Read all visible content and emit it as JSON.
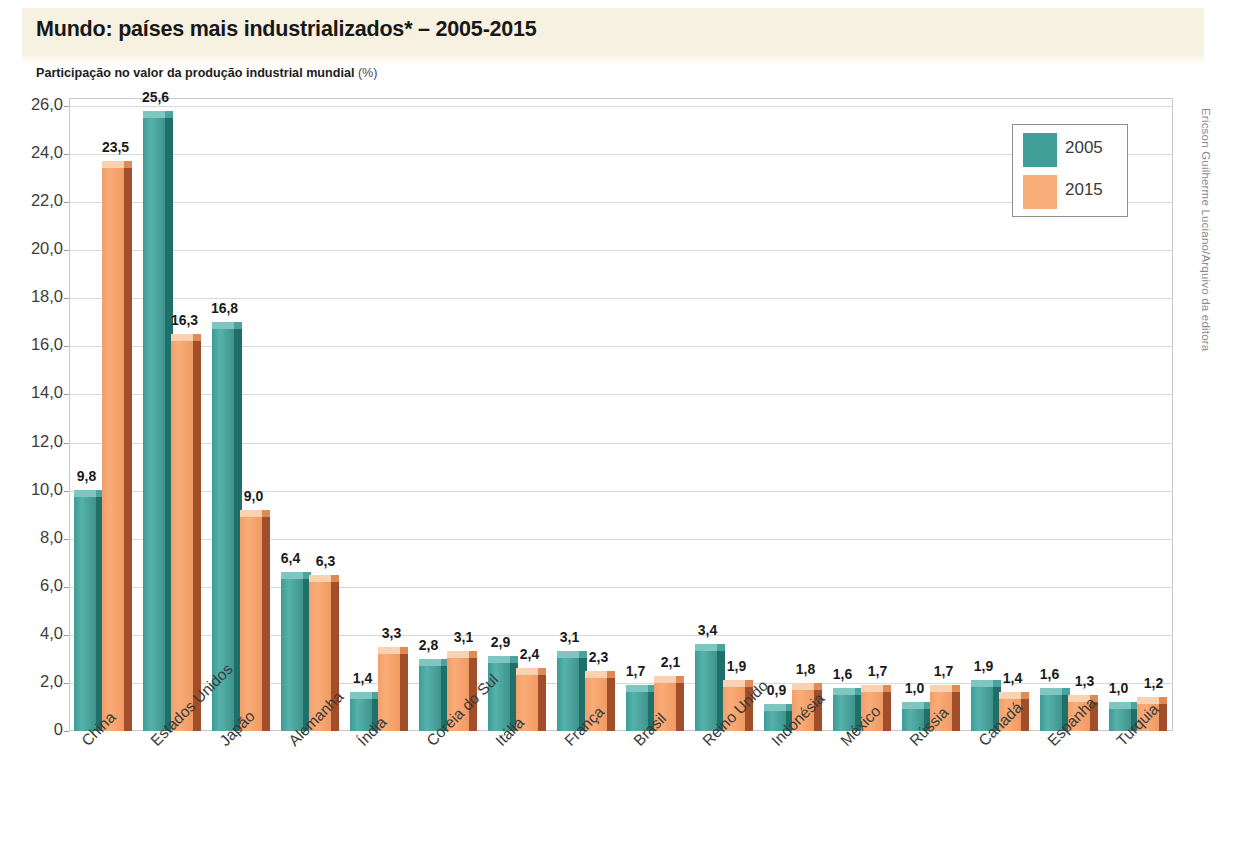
{
  "title": "Mundo: países mais industrializados* – 2005-2015",
  "subtitle_main": "Participação no valor da produção industrial mundial ",
  "subtitle_unit": "(%)",
  "credit": "Ericson Guilherme Luciano/Arquivo da editora",
  "legend": {
    "position": "top-right",
    "items": [
      {
        "label": "2005",
        "color": "#3f9f98"
      },
      {
        "label": "2015",
        "color": "#f8ac77"
      }
    ]
  },
  "axis": {
    "y_ticks": [
      "0",
      "2,0",
      "4,0",
      "6,0",
      "8,0",
      "10,0",
      "12,0",
      "14,0",
      "16,0",
      "18,0",
      "20,0",
      "22,0",
      "24,0",
      "26,0"
    ]
  },
  "chart_data": {
    "type": "bar",
    "title": "Mundo: países mais industrializados* – 2005-2015",
    "subtitle": "Participação no valor da produção industrial mundial (%)",
    "xlabel": "",
    "ylabel": "Participação no valor da produção industrial mundial (%)",
    "ylim": [
      0,
      26
    ],
    "ytick_step": 2,
    "grid": true,
    "legend_position": "top-right",
    "categories": [
      "China",
      "Estados Unidos",
      "Japão",
      "Alemanha",
      "Índia",
      "Coreia do Sul",
      "Itália",
      "França",
      "Brasil",
      "Reino Unido",
      "Indonésia",
      "México",
      "Rússia",
      "Canadá",
      "Espanha",
      "Turquia"
    ],
    "series": [
      {
        "name": "2005",
        "color": "#3f9f98",
        "values": [
          9.8,
          25.6,
          16.8,
          6.4,
          1.4,
          2.8,
          2.9,
          3.1,
          1.7,
          3.4,
          0.9,
          1.6,
          1.0,
          1.9,
          1.6,
          1.0
        ],
        "labels": [
          "9,8",
          "25,6",
          "16,8",
          "6,4",
          "1,4",
          "2,8",
          "2,9",
          "3,1",
          "1,7",
          "3,4",
          "0,9",
          "1,6",
          "1,0",
          "1,9",
          "1,6",
          "1,0"
        ]
      },
      {
        "name": "2015",
        "color": "#f8ac77",
        "values": [
          23.5,
          16.3,
          9.0,
          6.3,
          3.3,
          3.1,
          2.4,
          2.3,
          2.1,
          1.9,
          1.8,
          1.7,
          1.7,
          1.4,
          1.3,
          1.2
        ],
        "labels": [
          "23,5",
          "16,3",
          "9,0",
          "6,3",
          "3,3",
          "3,1",
          "2,4",
          "2,3",
          "2,1",
          "1,9",
          "1,8",
          "1,7",
          "1,7",
          "1,4",
          "1,3",
          "1,2"
        ]
      }
    ]
  }
}
